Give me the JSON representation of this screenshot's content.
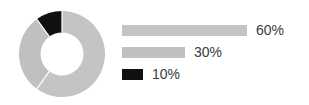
{
  "chart_data": {
    "type": "pie",
    "variant": "donut",
    "title": "",
    "subtitle": "",
    "xlabel": "",
    "ylabel": "",
    "grid": false,
    "legend_position": "right",
    "legend_style": "horizontal-bars",
    "categories": [
      "60%",
      "30%",
      "10%"
    ],
    "values": [
      60,
      30,
      10
    ],
    "value_labels": [
      "60%",
      "30%",
      "10%"
    ],
    "colors": [
      "#c4c4c4",
      "#c0c0c0",
      "#111111"
    ],
    "slices": [
      {
        "label": "60%",
        "value": 60,
        "color": "#c4c4c4",
        "start_angle_deg": 0,
        "end_angle_deg": 216
      },
      {
        "label": "30%",
        "value": 30,
        "color": "#c0c0c0",
        "start_angle_deg": 216,
        "end_angle_deg": 324
      },
      {
        "label": "10%",
        "value": 10,
        "color": "#111111",
        "start_angle_deg": 324,
        "end_angle_deg": 360
      }
    ],
    "inner_radius_ratio": 0.5,
    "separator_color": "#ffffff",
    "background": "#ffffff"
  },
  "donut": {
    "center_x": 44,
    "center_y": 44,
    "outer_radius": 43,
    "inner_radius": 21.5
  },
  "legend": {
    "text_color": "#3a3a3a",
    "rows": [
      {
        "label": "60%",
        "bar_width": 125,
        "color": "#c4c4c4"
      },
      {
        "label": "30%",
        "bar_width": 63,
        "color": "#c0c0c0"
      },
      {
        "label": "10%",
        "bar_width": 21,
        "color": "#111111"
      }
    ]
  }
}
